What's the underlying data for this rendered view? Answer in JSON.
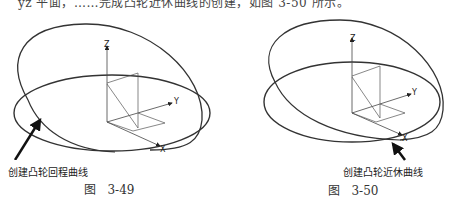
{
  "top_text": "yz 平面，……完成凸轮近休曲线的创建，如图 3-50 所示。",
  "figures": [
    {
      "id": "3-49",
      "caption_prefix": "图",
      "caption_number": "3-49",
      "annotation": "创建凸轮回程曲线",
      "axes": {
        "z": "Z",
        "y": "Y",
        "x": "X"
      }
    },
    {
      "id": "3-50",
      "caption_prefix": "图",
      "caption_number": "3-50",
      "annotation": "创建凸轮近休曲线",
      "axes": {
        "z": "Z",
        "y": "Y",
        "x": "X"
      }
    }
  ]
}
